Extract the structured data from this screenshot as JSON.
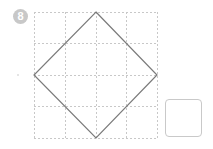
{
  "problem": {
    "number": "8"
  },
  "grid": {
    "rows": 4,
    "cols": 4,
    "line_color": "#c8c8c8",
    "style": "dotted"
  },
  "shape": {
    "type": "square rotated 45° (diamond)",
    "vertices": [
      "top-middle",
      "right-middle",
      "bottom-middle",
      "left-middle"
    ],
    "stroke_color": "#7a7a7a"
  },
  "answer_box": {
    "value": ""
  }
}
